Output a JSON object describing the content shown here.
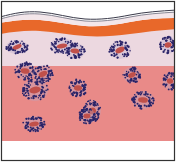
{
  "diagram": {
    "type": "tissue-cross-section-illustration",
    "text": [],
    "colors": {
      "background": "#ffffff",
      "border": "#333333",
      "surface_line": "#3a3a4a",
      "orange_layer": "#e8682a",
      "upper_layer": "#ecd8e0",
      "lower_layer": "#e98a88",
      "cluster_dots": "#2a2468",
      "cluster_core": "#c0504a"
    },
    "layers": [
      {
        "name": "surface-line",
        "y_top": 12,
        "y_bottom": 20
      },
      {
        "name": "orange-layer",
        "y_top": 18,
        "y_bottom": 34
      },
      {
        "name": "pale-pink-layer",
        "y_top": 30,
        "y_bottom": 66
      },
      {
        "name": "salmon-layer",
        "y_top": 66,
        "y_bottom": 141
      }
    ],
    "clusters": [
      {
        "cx": 17,
        "cy": 47,
        "rx": 11,
        "ry": 7
      },
      {
        "cx": 62,
        "cy": 46,
        "rx": 12,
        "ry": 8
      },
      {
        "cx": 75,
        "cy": 51,
        "rx": 10,
        "ry": 8
      },
      {
        "cx": 120,
        "cy": 50,
        "rx": 11,
        "ry": 9
      },
      {
        "cx": 168,
        "cy": 45,
        "rx": 8,
        "ry": 9
      },
      {
        "cx": 25,
        "cy": 71,
        "rx": 10,
        "ry": 9
      },
      {
        "cx": 43,
        "cy": 74,
        "rx": 10,
        "ry": 9
      },
      {
        "cx": 35,
        "cy": 90,
        "rx": 13,
        "ry": 11
      },
      {
        "cx": 78,
        "cy": 88,
        "rx": 9,
        "ry": 9
      },
      {
        "cx": 132,
        "cy": 75,
        "rx": 9,
        "ry": 8
      },
      {
        "cx": 170,
        "cy": 81,
        "rx": 7,
        "ry": 9
      },
      {
        "cx": 143,
        "cy": 100,
        "rx": 11,
        "ry": 9
      },
      {
        "cx": 92,
        "cy": 111,
        "rx": 9,
        "ry": 11
      },
      {
        "cx": 34,
        "cy": 124,
        "rx": 11,
        "ry": 8
      },
      {
        "cx": 87,
        "cy": 116,
        "rx": 8,
        "ry": 8
      }
    ]
  }
}
